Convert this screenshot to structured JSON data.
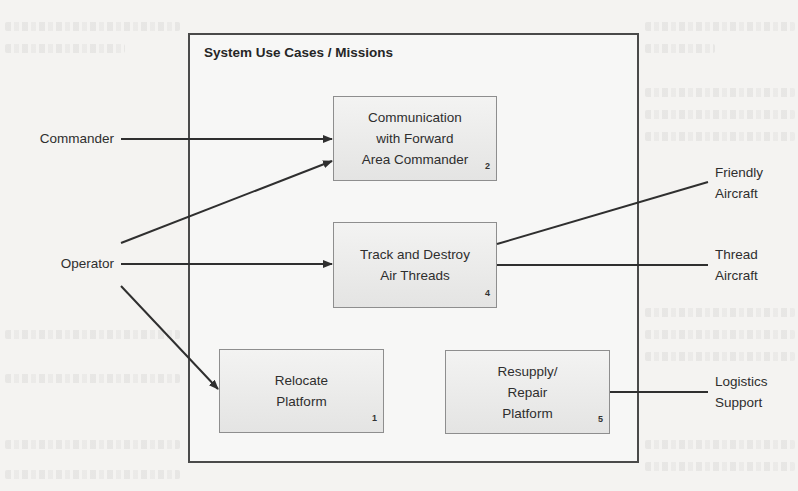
{
  "diagram": {
    "type": "use-case-diagram",
    "system": {
      "title": "System Use Cases / Missions"
    },
    "use_cases": [
      {
        "id": "uc2",
        "label": "Communication\nwith Forward\nArea Commander",
        "number": "2"
      },
      {
        "id": "uc4",
        "label": "Track and Destroy\nAir Threads",
        "number": "4"
      },
      {
        "id": "uc1",
        "label": "Relocate\nPlatform",
        "number": "1"
      },
      {
        "id": "uc5",
        "label": "Resupply/\nRepair\nPlatform",
        "number": "5"
      }
    ],
    "actors": {
      "commander": {
        "label": "Commander"
      },
      "operator": {
        "label": "Operator"
      },
      "friendly_aircraft": {
        "label": "Friendly\nAircraft"
      },
      "thread_aircraft": {
        "label": "Thread\nAircraft"
      },
      "logistics_support": {
        "label": "Logistics\nSupport"
      }
    },
    "relationships": [
      {
        "from": "Commander",
        "to": "Communication with Forward Area Commander",
        "arrow": true
      },
      {
        "from": "Operator",
        "to": "Communication with Forward Area Commander",
        "arrow": true
      },
      {
        "from": "Operator",
        "to": "Track and Destroy Air Threads",
        "arrow": true
      },
      {
        "from": "Operator",
        "to": "Relocate Platform",
        "arrow": true
      },
      {
        "from": "Track and Destroy Air Threads",
        "to": "Friendly Aircraft",
        "arrow": false
      },
      {
        "from": "Track and Destroy Air Threads",
        "to": "Thread Aircraft",
        "arrow": false
      },
      {
        "from": "Resupply/Repair Platform",
        "to": "Logistics Support",
        "arrow": false
      }
    ],
    "colors": {
      "line": "#2f2f2f",
      "system_border": "#4a4a4a",
      "box_border": "#8e8e8e",
      "box_fill_top": "#f3f3f2",
      "box_fill_bottom": "#e4e4e3",
      "page": "#f4f3f1"
    }
  }
}
